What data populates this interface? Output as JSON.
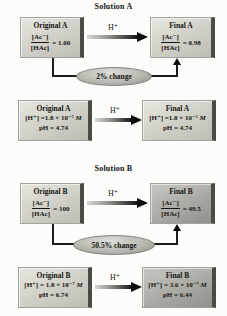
{
  "palette": {
    "box_light_top": "#e7e7df",
    "box_light_bottom": "#bdbdb5",
    "box_dark_top": "#c7c7c1",
    "box_dark_bottom": "#90908a",
    "box_edge": "#4b4b45",
    "arrow_black": "#0c0c0c",
    "oval_gray": "#b9b9b1",
    "background": "#fcfcfa"
  },
  "sections": [
    {
      "title": "Solution A",
      "ratio_row": {
        "left": {
          "title": "Original A",
          "num": "[Ac⁻]",
          "den": "[HAc]",
          "eq": "= 1.00"
        },
        "arrow_label": "H⁺",
        "right": {
          "title": "Final A",
          "num": "[Ac⁻]",
          "den": "[HAc]",
          "eq": "= 0.98"
        },
        "change_label": "2% change"
      },
      "ph_row": {
        "left": {
          "title": "Original A",
          "conc": "[H⁺] =1.8 × 10⁻⁵",
          "unit": "M",
          "ph": "pH = 4.74"
        },
        "arrow_label": "H⁺",
        "right": {
          "title": "Final A",
          "conc": "[H⁺] =1.8 × 10⁻⁵",
          "unit": "M",
          "ph": "pH = 4.74"
        }
      }
    },
    {
      "title": "Solution B",
      "ratio_row": {
        "left": {
          "title": "Original B",
          "num": "[Ac⁻]",
          "den": "[HAc]",
          "eq": "= 100"
        },
        "arrow_label": "H⁺",
        "right": {
          "title": "Final B",
          "num": "[Ac⁻]",
          "den": "[HAc]",
          "eq": "= 49.5"
        },
        "change_label": "50.5% change"
      },
      "ph_row": {
        "left": {
          "title": "Original B",
          "conc": "[H⁺] = 1.8 × 10⁻⁷",
          "unit": "M",
          "ph": "pH = 6.74"
        },
        "arrow_label": "H⁺",
        "right": {
          "title": "Final B",
          "conc": "[H⁺] = 3.6 × 10⁻⁷",
          "unit": "M",
          "ph": "pH = 6.44"
        }
      }
    }
  ]
}
